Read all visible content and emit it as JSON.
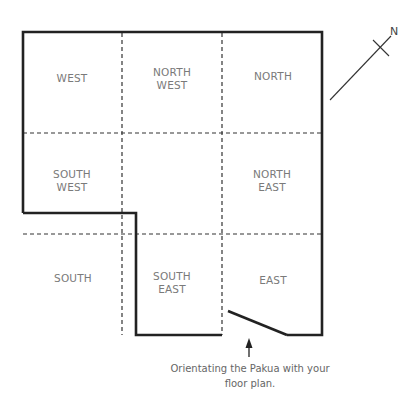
{
  "diagram": {
    "zones": [
      {
        "id": "west",
        "lines": [
          "WEST"
        ]
      },
      {
        "id": "north-west",
        "lines": [
          "NORTH",
          "WEST"
        ]
      },
      {
        "id": "north",
        "lines": [
          "NORTH"
        ]
      },
      {
        "id": "south-west",
        "lines": [
          "SOUTH",
          "WEST"
        ]
      },
      {
        "id": "center",
        "lines": []
      },
      {
        "id": "north-east",
        "lines": [
          "NORTH",
          "EAST"
        ]
      },
      {
        "id": "south",
        "lines": [
          "SOUTH"
        ]
      },
      {
        "id": "south-east",
        "lines": [
          "SOUTH",
          "EAST"
        ]
      },
      {
        "id": "east",
        "lines": [
          "EAST"
        ]
      }
    ],
    "compass": {
      "label": "N"
    },
    "caption": {
      "line1": "Orientating the Pakua with your",
      "line2": "floor plan."
    },
    "colors": {
      "wall": "#222222",
      "grid": "#333333",
      "label": "#7a7a7a",
      "caption": "#666666"
    }
  }
}
